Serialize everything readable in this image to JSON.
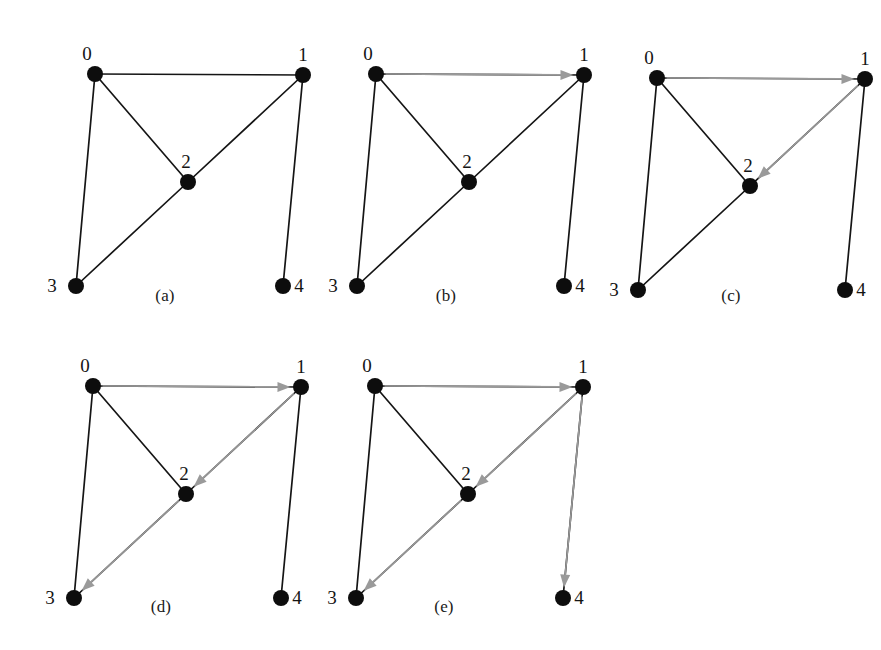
{
  "figure": {
    "type": "graph-traversal-sequence",
    "background_color": "#ffffff",
    "edge_color": "#151515",
    "arrow_color": "#9a9a9a",
    "vertex_color": "#0d0d0d",
    "vertex_radius": 8,
    "node_ids": [
      "0",
      "1",
      "2",
      "3",
      "4"
    ],
    "base_edges": [
      [
        "0",
        "1"
      ],
      [
        "0",
        "2"
      ],
      [
        "0",
        "3"
      ],
      [
        "1",
        "2"
      ],
      [
        "1",
        "4"
      ],
      [
        "2",
        "3"
      ]
    ],
    "layout": {
      "0": {
        "x": 75,
        "y": 54,
        "label_dx": -8,
        "label_dy": -14
      },
      "1": {
        "x": 283,
        "y": 55,
        "label_dx": 0,
        "label_dy": -14
      },
      "2": {
        "x": 168,
        "y": 162,
        "label_dx": -2,
        "label_dy": -14
      },
      "3": {
        "x": 56,
        "y": 266,
        "label_dx": -24,
        "label_dy": 6
      },
      "4": {
        "x": 263,
        "y": 266,
        "label_dx": 16,
        "label_dy": 6
      }
    },
    "panels": [
      {
        "id": "panel-a",
        "caption": "(a)",
        "origin_x": 20,
        "origin_y": 20,
        "caption_x": 165,
        "caption_y": 286,
        "arrows": []
      },
      {
        "id": "panel-b",
        "caption": "(b)",
        "origin_x": 301,
        "origin_y": 20,
        "caption_x": 446,
        "caption_y": 286,
        "arrows": [
          [
            "0",
            "1"
          ]
        ]
      },
      {
        "id": "panel-c",
        "caption": "(c)",
        "origin_x": 582,
        "origin_y": 24,
        "caption_x": 731,
        "caption_y": 286,
        "arrows": [
          [
            "0",
            "1"
          ],
          [
            "1",
            "2"
          ]
        ]
      },
      {
        "id": "panel-d",
        "caption": "(d)",
        "origin_x": 18,
        "origin_y": 332,
        "caption_x": 161,
        "caption_y": 597,
        "arrows": [
          [
            "0",
            "1"
          ],
          [
            "1",
            "2"
          ],
          [
            "2",
            "3"
          ]
        ]
      },
      {
        "id": "panel-e",
        "caption": "(e)",
        "origin_x": 300,
        "origin_y": 332,
        "caption_x": 444,
        "caption_y": 597,
        "arrows": [
          [
            "0",
            "1"
          ],
          [
            "1",
            "2"
          ],
          [
            "2",
            "3"
          ],
          [
            "1",
            "4"
          ]
        ]
      }
    ]
  }
}
